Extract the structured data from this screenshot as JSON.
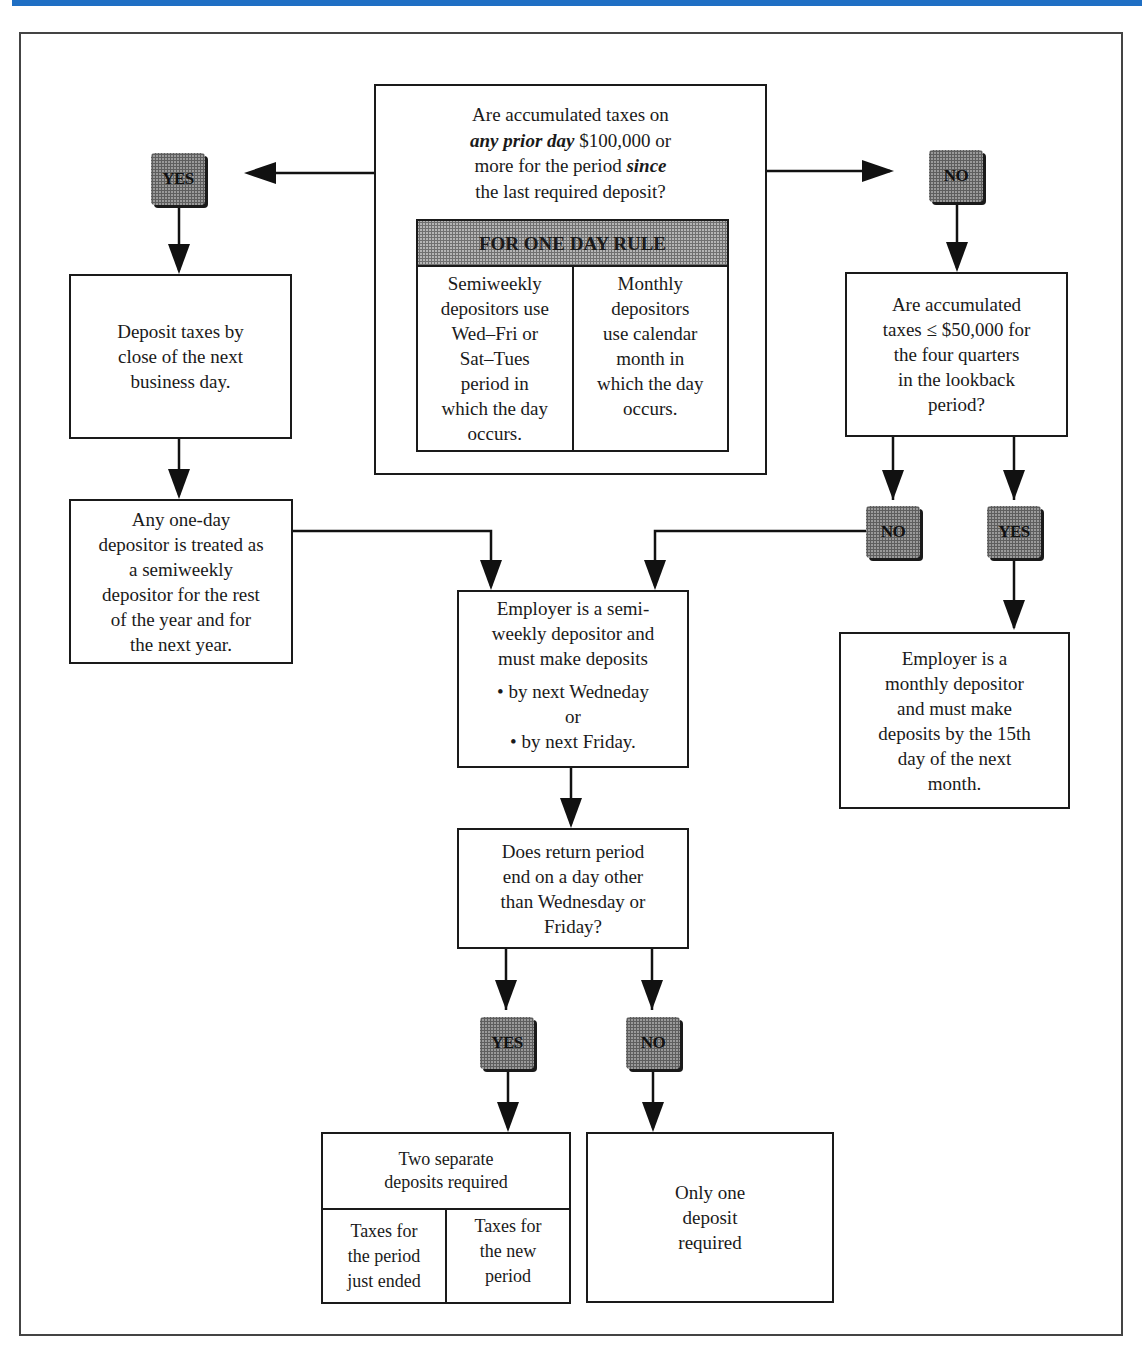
{
  "header_bar_color": "#1f6fc4",
  "main_question": {
    "line1": "Are accumulated taxes on",
    "line2_em": "any prior day",
    "line2_rest": " $100,000 or",
    "line3_start": "more for the period ",
    "line3_em": "since",
    "line4": "the last required deposit?"
  },
  "one_day_rule": {
    "title": "FOR ONE DAY RULE",
    "left": "Semiweekly\ndepositors use\nWed–Fri or\nSat–Tues\nperiod in\nwhich the day\noccurs.",
    "right": "Monthly\ndepositors\nuse calendar\nmonth in\nwhich the day\noccurs."
  },
  "badges": {
    "yes_left": "YES",
    "no_right": "NO",
    "no_lookback": "NO",
    "yes_lookback": "YES",
    "yes_return": "YES",
    "no_return": "NO"
  },
  "boxes": {
    "deposit_next_day": "Deposit taxes by\nclose of the next\nbusiness day.",
    "one_day_depositor": "Any one-day\ndepositor is treated as\na semiweekly\ndepositor for the rest\nof the year and for\nthe next year.",
    "lookback_question": "Are accumulated\ntaxes ≤ $50,000 for\nthe four quarters\nin the lookback\nperiod?",
    "semiweekly_depositor": "Employer is a semi-\nweekly depositor and\nmust make deposits",
    "semiweekly_options": "• by next Wedneday\nor\n• by next Friday.",
    "monthly_depositor": "Employer is a\nmonthly depositor\nand must make\ndeposits by the 15th\nday of the next\nmonth.",
    "return_period_question": "Does return period\nend on a day other\nthan Wednesday or\nFriday?",
    "two_deposits_title": "Two separate\ndeposits required",
    "two_deposits_left": "Taxes for\nthe period\njust ended",
    "two_deposits_right": "Taxes for\nthe new\nperiod",
    "one_deposit": "Only one\ndeposit\nrequired"
  }
}
